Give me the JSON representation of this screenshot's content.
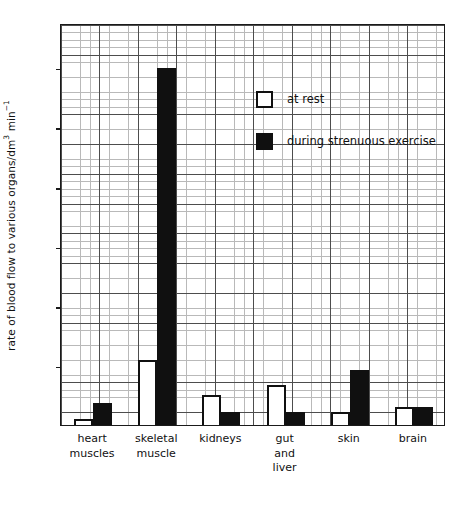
{
  "chart_data": {
    "type": "bar",
    "title": "",
    "xlabel": "",
    "ylabel": "rate of blood flow to various organs/dm3 min-1",
    "ylabel_parts": {
      "prefix": "rate of blood flow to various organs/dm",
      "sup1": "3",
      "mid": " min",
      "sup2": "−1"
    },
    "categories": [
      "heart\nmuscles",
      "skeletal\nmuscle",
      "kidneys",
      "gut\nand\nliver",
      "skin",
      "brain"
    ],
    "series": [
      {
        "name": "at rest",
        "style": "open",
        "color": "#ffffff",
        "edge_color": "#101010",
        "values": [
          0.2,
          2.2,
          1.0,
          1.35,
          0.45,
          0.6
        ]
      },
      {
        "name": "during strenuous exercise",
        "style": "filled",
        "color": "#101010",
        "edge_color": "#101010",
        "values": [
          0.75,
          12.0,
          0.45,
          0.45,
          1.85,
          0.6
        ]
      }
    ],
    "ylim": [
      0,
      13.5
    ],
    "yticks": [
      2,
      4,
      6,
      8,
      10,
      12
    ],
    "ytick_labels": [
      "2",
      "4",
      "6",
      "8",
      "10",
      "12"
    ],
    "grid": "on",
    "grid_major_step": 1,
    "grid_minor_step": 0.25,
    "legend_position": "upper center"
  },
  "legend": {
    "entries": [
      {
        "label": "at rest",
        "swatch": "open-square"
      },
      {
        "label": "during strenuous exercise",
        "swatch": "filled-square"
      }
    ]
  }
}
